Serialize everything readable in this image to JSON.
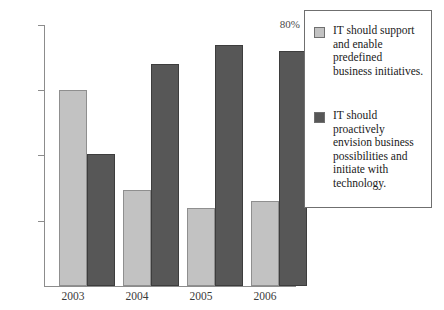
{
  "chart_data": {
    "type": "bar",
    "title": "",
    "subtitle": "",
    "xlabel": "",
    "ylabel": "",
    "categories": [
      "2003",
      "2004",
      "2005",
      "2006"
    ],
    "ylim": [
      0,
      80
    ],
    "ytick_values": [
      20,
      40,
      60,
      80
    ],
    "ytick_labels": [
      "20%",
      "40%",
      "60%",
      "80%"
    ],
    "grid": false,
    "legend_position": "right",
    "series": [
      {
        "name": "IT should support and enable predefined business initiatives.",
        "color": "#c2c2c2",
        "values": [
          60,
          29.5,
          24,
          26
        ]
      },
      {
        "name": "IT should proactively envision business possibilities and initiate with technology.",
        "color": "#575757",
        "values": [
          40.5,
          68,
          74,
          72
        ]
      }
    ]
  },
  "axes": {
    "y_ticks": [
      {
        "label": "80%",
        "value": 80
      },
      {
        "label": "60%",
        "value": 60
      },
      {
        "label": "40%",
        "value": 40
      },
      {
        "label": "20%",
        "value": 20
      }
    ],
    "x_categories": [
      {
        "label": "2003"
      },
      {
        "label": "2004"
      },
      {
        "label": "2005"
      },
      {
        "label": "2006"
      }
    ]
  },
  "legend": {
    "entries": [
      {
        "color": "#c2c2c2",
        "lines": [
          "IT should support",
          "and enable",
          "predefined",
          "business initiatives."
        ]
      },
      {
        "color": "#575757",
        "lines": [
          "IT should",
          "proactively",
          "envision business",
          "possibilities and",
          "initiate with",
          "technology."
        ]
      }
    ]
  }
}
